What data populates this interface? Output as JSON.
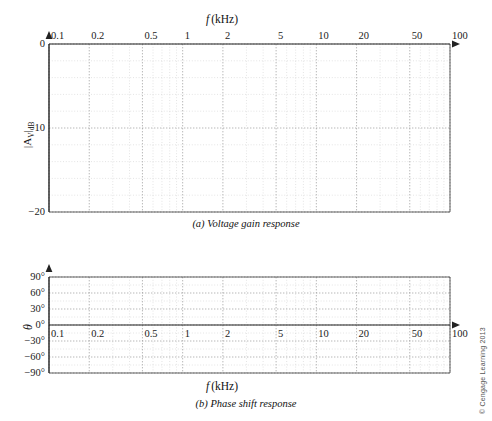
{
  "figure": {
    "credit": "© Cengage Learning 2013",
    "background": "#ffffff",
    "axis_color": "#222222",
    "grid_major_color": "#9a9a9a",
    "grid_minor_color": "#c9c9c9"
  },
  "charts": [
    {
      "id": "voltage-gain-response",
      "caption_label": "(a)",
      "caption_text": "Voltage gain response",
      "xlabel": "f (kHz)",
      "xlabel_italic": "f",
      "xlabel_rest": "(kHz)",
      "xlabel_position": "top",
      "ylabel": "|A_v|_dB",
      "ylabel_parts": {
        "pre": "|A",
        "sub1": "V",
        "mid": "|",
        "sub2": "dB"
      },
      "xscale": "log",
      "xlim": [
        0.1,
        100
      ],
      "xticks": [
        0.1,
        0.2,
        0.5,
        1,
        2,
        5,
        10,
        20,
        50,
        100
      ],
      "xticklabels": [
        "0.1",
        "0.2",
        "0.5",
        "1",
        "2",
        "5",
        "10",
        "20",
        "50",
        "100"
      ],
      "ylim": [
        -20,
        0
      ],
      "yticks": [
        0,
        -10,
        -20
      ],
      "yticklabels": [
        "0",
        "−10",
        "−20"
      ],
      "y_minor_step": 2,
      "grid": true,
      "series": []
    },
    {
      "id": "phase-shift-response",
      "caption_label": "(b)",
      "caption_text": "Phase shift response",
      "xlabel": "f (kHz)",
      "xlabel_italic": "f",
      "xlabel_rest": "(kHz)",
      "xlabel_position": "bottom",
      "ylabel": "θ",
      "xscale": "log",
      "xlim": [
        0.1,
        100
      ],
      "xticks": [
        0.1,
        0.2,
        0.5,
        1,
        2,
        5,
        10,
        20,
        50,
        100
      ],
      "xticklabels": [
        "0.1",
        "0.2",
        "0.5",
        "1",
        "2",
        "5",
        "10",
        "20",
        "50",
        "100"
      ],
      "ylim": [
        -90,
        90
      ],
      "yticks": [
        90,
        60,
        30,
        0,
        -30,
        -60,
        -90
      ],
      "yticklabels": [
        "90°",
        "60°",
        "30°",
        "0°",
        "−30°",
        "−60°",
        "−90°"
      ],
      "y_minor_step": 15,
      "grid": true,
      "series": []
    }
  ],
  "chart_data": [
    {
      "type": "line",
      "title": "(a) Voltage gain response",
      "xlabel": "f (kHz)",
      "ylabel": "|Av|dB",
      "xscale": "log",
      "xlim": [
        0.1,
        100
      ],
      "ylim": [
        -20,
        0
      ],
      "xticks": [
        0.1,
        0.2,
        0.5,
        1,
        2,
        5,
        10,
        20,
        50,
        100
      ],
      "yticks": [
        0,
        -10,
        -20
      ],
      "grid": true,
      "legend": null,
      "series": [],
      "note": "Blank log-linear graph paper; no data plotted"
    },
    {
      "type": "line",
      "title": "(b) Phase shift response",
      "xlabel": "f (kHz)",
      "ylabel": "θ",
      "xscale": "log",
      "xlim": [
        0.1,
        100
      ],
      "ylim": [
        -90,
        90
      ],
      "xticks": [
        0.1,
        0.2,
        0.5,
        1,
        2,
        5,
        10,
        20,
        50,
        100
      ],
      "yticks": [
        90,
        60,
        30,
        0,
        -30,
        -60,
        -90
      ],
      "grid": true,
      "legend": null,
      "series": [],
      "note": "Blank log-linear graph paper; no data plotted"
    }
  ]
}
